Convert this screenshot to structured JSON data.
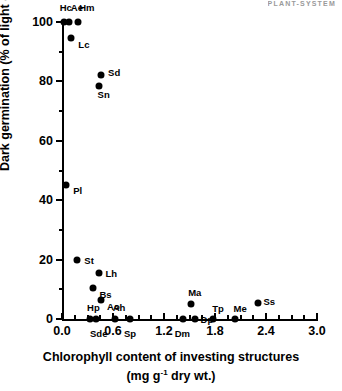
{
  "header": {
    "running_head": "PLANT-SYSTEM"
  },
  "chart_data": {
    "type": "scatter",
    "title": "",
    "xlabel": "Chlorophyll content of investing structures",
    "xlabel_units": "(mg g-1 dry wt.)",
    "ylabel": "Dark germination (% of light germination)",
    "xlim": [
      0.0,
      3.0
    ],
    "ylim": [
      0,
      100
    ],
    "grid": false,
    "legend": "none",
    "x_ticks_major": [
      "0.0",
      "0.6",
      "1.2",
      "1.8",
      "2.4",
      "3.0"
    ],
    "x_tick_values": [
      0.0,
      0.6,
      1.2,
      1.8,
      2.4,
      3.0
    ],
    "x_minor_step": 0.15,
    "y_ticks_major": [
      "0",
      "20",
      "40",
      "60",
      "80",
      "100"
    ],
    "y_tick_values": [
      0,
      20,
      40,
      60,
      80,
      100
    ],
    "y_minor_step": 10,
    "points": [
      {
        "label": "Hc",
        "x": 0.02,
        "y": 100,
        "lx": -4,
        "ly": -19
      },
      {
        "label": "Ae",
        "x": 0.08,
        "y": 100,
        "lx": 2,
        "ly": -19
      },
      {
        "label": "Hm",
        "x": 0.19,
        "y": 100,
        "lx": 1,
        "ly": -19
      },
      {
        "label": "Lc",
        "x": 0.11,
        "y": 94.5,
        "lx": 7,
        "ly": 2
      },
      {
        "label": "Sd",
        "x": 0.46,
        "y": 82,
        "lx": 7,
        "ly": -7
      },
      {
        "label": "Sn",
        "x": 0.43,
        "y": 78.5,
        "lx": -1,
        "ly": 4
      },
      {
        "label": "Pl",
        "x": 0.05,
        "y": 45,
        "lx": 7,
        "ly": 1
      },
      {
        "label": "St",
        "x": 0.18,
        "y": 20,
        "lx": 7,
        "ly": -4
      },
      {
        "label": "Lh",
        "x": 0.44,
        "y": 15.5,
        "lx": 6,
        "ly": -4
      },
      {
        "label": "Bs",
        "x": 0.37,
        "y": 10.5,
        "lx": 6,
        "ly": 2
      },
      {
        "label": "Ao",
        "x": 0.46,
        "y": 6.5,
        "lx": 6,
        "ly": 2
      },
      {
        "label": "Hp",
        "x": 0.33,
        "y": 0,
        "lx": -3,
        "ly": -16
      },
      {
        "label": "Sde",
        "x": 0.4,
        "y": 0,
        "lx": -6,
        "ly": 10
      },
      {
        "label": "Ah",
        "x": 0.62,
        "y": 0,
        "lx": -2,
        "ly": -16
      },
      {
        "label": "Sp",
        "x": 0.8,
        "y": 0,
        "lx": -6,
        "ly": 10
      },
      {
        "label": "Ma",
        "x": 1.52,
        "y": 5,
        "lx": -3,
        "ly": -16
      },
      {
        "label": "Dm",
        "x": 1.42,
        "y": 0,
        "lx": -8,
        "ly": 10
      },
      {
        "label": "Dp",
        "x": 1.56,
        "y": 0,
        "lx": 6,
        "ly": -4
      },
      {
        "label": "Tp",
        "x": 1.78,
        "y": 0,
        "lx": -1,
        "ly": -15
      },
      {
        "label": "Me",
        "x": 2.03,
        "y": 0,
        "lx": -1,
        "ly": -15
      },
      {
        "label": "Ss",
        "x": 2.3,
        "y": 5.5,
        "lx": 6,
        "ly": -6
      }
    ]
  }
}
